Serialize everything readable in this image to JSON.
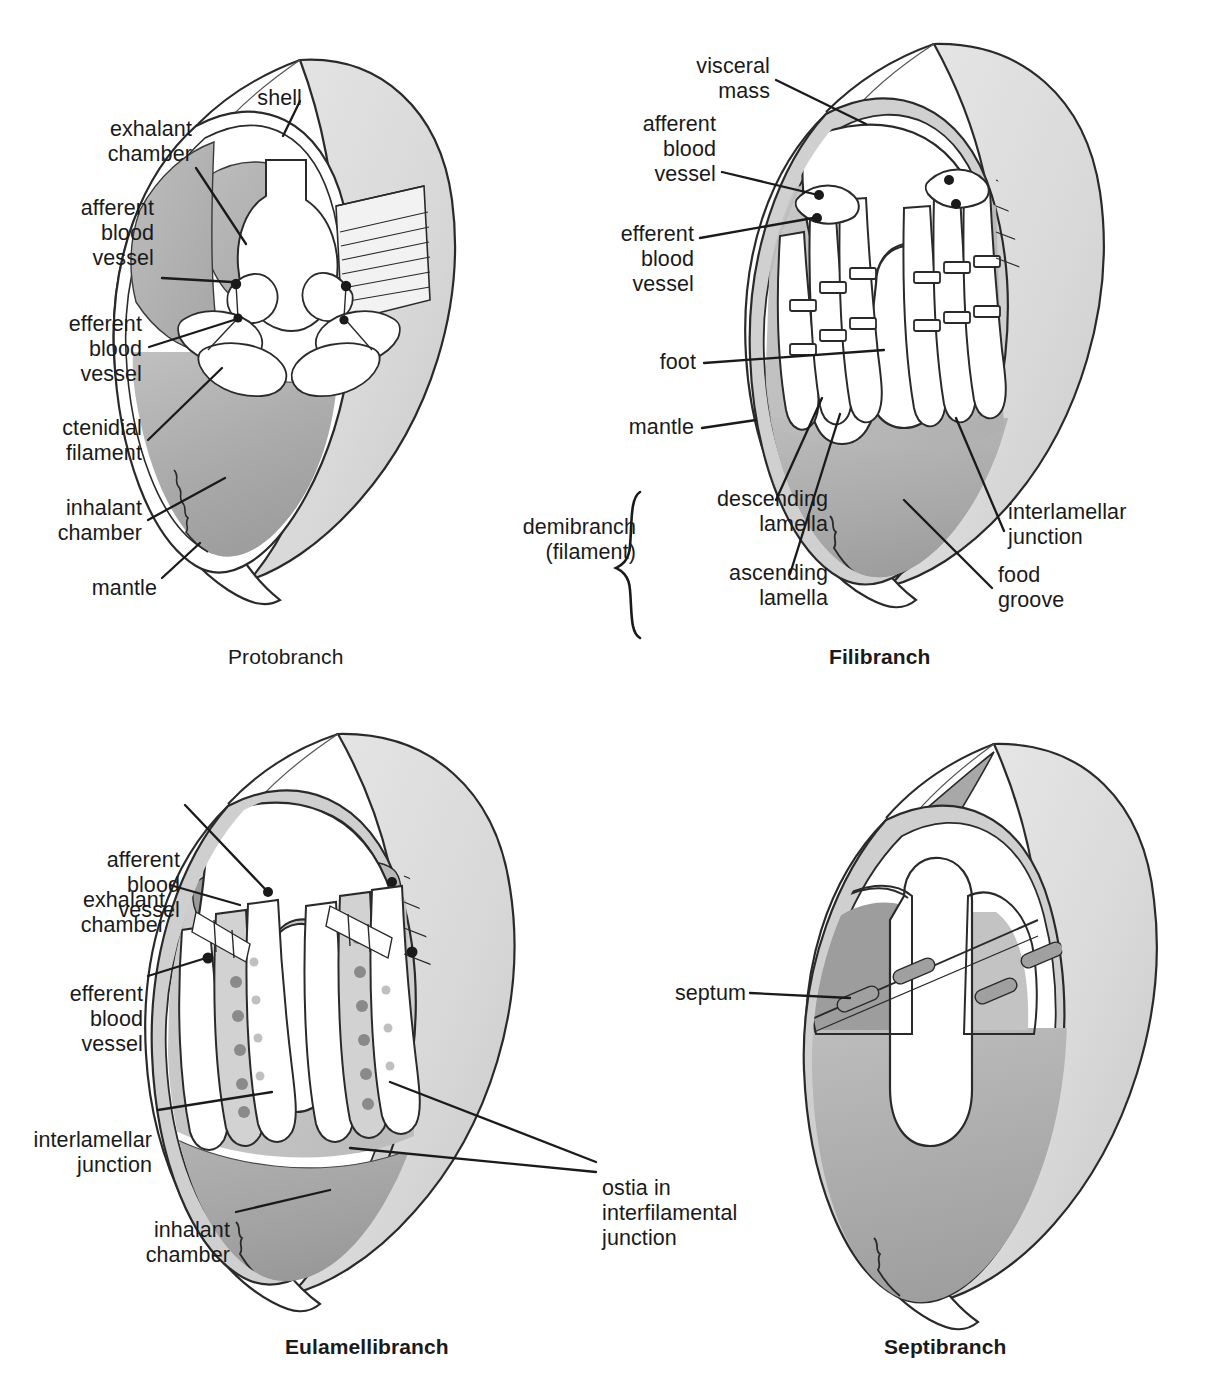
{
  "figure": {
    "panel_count": 4
  },
  "colors": {
    "ink": "#1a1a1a",
    "shell_outer": "#dcdcdc",
    "shell_edge": "#c6c6c6",
    "mantle_band": "#c9c9c9",
    "exhalant_gray": "#9b9b9b",
    "inhalant_gray": "#b2b2b2",
    "deep_gray": "#8d8d8d",
    "tissue_white": "#ffffff",
    "ostia_dot": "#8a8a8a",
    "septum_gray": "#a8a8a8"
  },
  "panels": [
    {
      "id": "protobranch",
      "caption": "Protobranch",
      "caption_bold": false,
      "labels": [
        {
          "id": "shell",
          "text": "shell",
          "align": "right"
        },
        {
          "id": "exhalant-chamber",
          "text": "exhalant\nchamber",
          "align": "right"
        },
        {
          "id": "afferent-vessel",
          "text": "afferent\nblood\nvessel",
          "align": "right"
        },
        {
          "id": "efferent-vessel",
          "text": "efferent\nblood\nvessel",
          "align": "right"
        },
        {
          "id": "ctenidial-filament",
          "text": "ctenidial\nfilament",
          "align": "right"
        },
        {
          "id": "inhalant-chamber",
          "text": "inhalant\nchamber",
          "align": "right"
        },
        {
          "id": "mantle",
          "text": "mantle",
          "align": "right"
        }
      ]
    },
    {
      "id": "filibranch",
      "caption": "Filibranch",
      "caption_bold": true,
      "labels": [
        {
          "id": "visceral-mass",
          "text": "visceral\nmass",
          "align": "right"
        },
        {
          "id": "afferent-vessel",
          "text": "afferent\nblood\nvessel",
          "align": "right"
        },
        {
          "id": "efferent-vessel",
          "text": "efferent\nblood\nvessel",
          "align": "right"
        },
        {
          "id": "foot",
          "text": "foot",
          "align": "right"
        },
        {
          "id": "mantle",
          "text": "mantle",
          "align": "right"
        },
        {
          "id": "demibranch",
          "text": "demibranch\n(filament)",
          "align": "right"
        },
        {
          "id": "descending-lamella",
          "text": "descending\nlamella",
          "align": "right"
        },
        {
          "id": "ascending-lamella",
          "text": "ascending\nlamella",
          "align": "right"
        },
        {
          "id": "interlamellar-junction",
          "text": "interlamellar\njunction",
          "align": "left"
        },
        {
          "id": "food-groove",
          "text": "food\ngroove",
          "align": "left"
        }
      ]
    },
    {
      "id": "eulamellibranch",
      "caption": "Eulamellibranch",
      "caption_bold": true,
      "labels": [
        {
          "id": "afferent-vessel",
          "text": "afferent\nblood\nvessel",
          "align": "right"
        },
        {
          "id": "exhalant-chamber",
          "text": "exhalant\nchamber",
          "align": "right"
        },
        {
          "id": "efferent-vessel",
          "text": "efferent\nblood\nvessel",
          "align": "right"
        },
        {
          "id": "interlamellar-junction",
          "text": "interlamellar\njunction",
          "align": "right"
        },
        {
          "id": "inhalant-chamber",
          "text": "inhalant\nchamber",
          "align": "right"
        },
        {
          "id": "ostia",
          "text": "ostia in\ninterfilamental\njunction",
          "align": "left"
        }
      ]
    },
    {
      "id": "septibranch",
      "caption": "Septibranch",
      "caption_bold": true,
      "labels": [
        {
          "id": "septum",
          "text": "septum",
          "align": "right"
        }
      ]
    }
  ],
  "protobranch": {
    "l_shell": "shell",
    "l_exhalant": "exhalant\nchamber",
    "l_afferent": "afferent\nblood\nvessel",
    "l_efferent": "efferent\nblood\nvessel",
    "l_ctenidial": "ctenidial\nfilament",
    "l_inhalant": "inhalant\nchamber",
    "l_mantle": "mantle",
    "caption": "Protobranch"
  },
  "filibranch": {
    "l_visceral": "visceral\nmass",
    "l_afferent": "afferent\nblood\nvessel",
    "l_efferent": "efferent\nblood\nvessel",
    "l_foot": "foot",
    "l_mantle": "mantle",
    "l_demibranch": "demibranch\n(filament)",
    "l_descending": "descending\nlamella",
    "l_ascending": "ascending\nlamella",
    "l_interlamellar": "interlamellar\njunction",
    "l_food": "food\ngroove",
    "caption": "Filibranch"
  },
  "eulamellibranch": {
    "l_afferent": "afferent\nblood\nvessel",
    "l_exhalant": "exhalant\nchamber",
    "l_efferent": "efferent\nblood\nvessel",
    "l_interlamellar": "interlamellar\njunction",
    "l_inhalant": "inhalant\nchamber",
    "l_ostia": "ostia in\ninterfilamental\njunction",
    "caption": "Eulamellibranch"
  },
  "septibranch": {
    "l_septum": "septum",
    "caption": "Septibranch"
  }
}
